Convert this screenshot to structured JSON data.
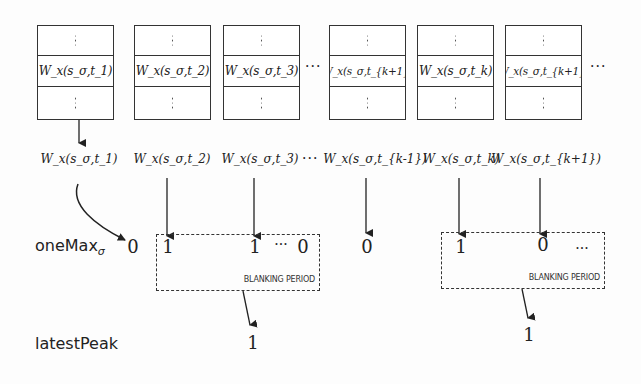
{
  "buffers": [
    {
      "label": "W_x(s_σ,t_1)",
      "left": 37
    },
    {
      "label": "W_x(s_σ,t_2)",
      "left": 134
    },
    {
      "label": "W_x(s_σ,t_3)",
      "left": 223
    },
    {
      "label": "W_x(s_σ,t_{k+1})",
      "left": 329
    },
    {
      "label": "W_x(s_σ,t_k)",
      "left": 417
    },
    {
      "label": "W_x(s_σ,t_{k+1})",
      "left": 505
    }
  ],
  "buffer_dots": "⋮",
  "ellipsis": "···",
  "samples": [
    {
      "label": "W_x(s_σ,t_1)",
      "x": 79
    },
    {
      "label": "W_x(s_σ,t_2)",
      "x": 172
    },
    {
      "label": "W_x(s_σ,t_3)",
      "x": 260
    },
    {
      "label": "W_x(s_σ,t_{k-1})",
      "x": 367
    },
    {
      "label": "W_x(s_σ,t_k)",
      "x": 461
    },
    {
      "label": "W_x(s_σ,t_{k+1})",
      "x": 546
    }
  ],
  "onemax": {
    "row_label": "oneMax",
    "row_subscript": "σ",
    "values": [
      {
        "text": "0",
        "x": 133
      },
      {
        "text": "1",
        "x": 168
      },
      {
        "text": "1",
        "x": 255
      },
      {
        "text": "···",
        "x": 281
      },
      {
        "text": "0",
        "x": 302
      },
      {
        "text": "0",
        "x": 367
      },
      {
        "text": "1",
        "x": 461
      },
      {
        "text": "0",
        "x": 543
      },
      {
        "text": "...",
        "x": 580
      }
    ]
  },
  "blanking_periods": [
    {
      "label": "BLANKING PERIOD",
      "left": 156,
      "top": 234,
      "width": 164,
      "height": 57
    },
    {
      "label": "BLANKING PERIOD",
      "left": 441,
      "top": 232,
      "width": 164,
      "height": 57
    }
  ],
  "latest_peak": {
    "row_label": "latestPeak",
    "values": [
      {
        "text": "1",
        "x": 203,
        "y": 336
      },
      {
        "text": "1",
        "x": 429,
        "y": 327
      }
    ]
  }
}
